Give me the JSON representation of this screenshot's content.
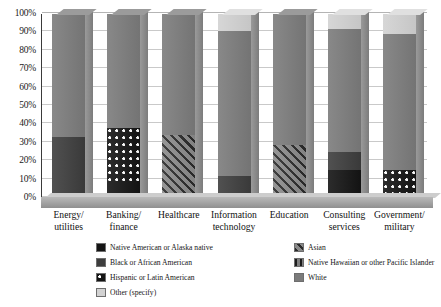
{
  "chart_data": {
    "type": "bar",
    "subtype": "100-percent-stacked-bar-3d",
    "title": "",
    "subtitle": "",
    "xlabel": "",
    "ylabel": "",
    "ylim": [
      0,
      100
    ],
    "yticks": [
      "0%",
      "10%",
      "20%",
      "30%",
      "40%",
      "50%",
      "60%",
      "70%",
      "80%",
      "90%",
      "100%"
    ],
    "ytick_values": [
      0,
      10,
      20,
      30,
      40,
      50,
      60,
      70,
      80,
      90,
      100
    ],
    "grid": true,
    "legend_position": "bottom",
    "categories": [
      "Energy/ utilities",
      "Banking/ finance",
      "Healthcare",
      "Information technology",
      "Education",
      "Consulting services",
      "Government/ military"
    ],
    "category_lines": [
      [
        "Energy/",
        "utilities"
      ],
      [
        "Banking/",
        "finance"
      ],
      [
        "Healthcare",
        ""
      ],
      [
        "Information",
        "technology"
      ],
      [
        "Education",
        ""
      ],
      [
        "Consulting",
        "services"
      ],
      [
        "Government/",
        "military"
      ]
    ],
    "series": [
      {
        "name": "Native American or Alaska native",
        "key": "native",
        "color": "#141414",
        "pattern": "solid-black",
        "values": [
          0,
          8,
          0,
          0,
          0,
          15,
          0
        ]
      },
      {
        "name": "Black or African American",
        "key": "black",
        "color": "#3d3d3d",
        "pattern": "solid-dark-gray",
        "values": [
          33,
          0,
          0,
          12,
          0,
          10,
          0
        ]
      },
      {
        "name": "Hispanic or Latin American",
        "key": "hispanic",
        "color": "#141414",
        "pattern": "black-with-white-dots",
        "values": [
          0,
          30,
          0,
          0,
          0,
          0,
          15
        ]
      },
      {
        "name": "Other (specify)",
        "key": "other",
        "color": "#d2d2d2",
        "pattern": "solid-light-gray",
        "values": [
          0,
          0,
          0,
          9,
          0,
          8,
          11
        ]
      },
      {
        "name": "Asian",
        "key": "asian",
        "color": "#8a8a8a",
        "pattern": "diagonal-hatch",
        "values": [
          0,
          0,
          34,
          0,
          29,
          0,
          0
        ]
      },
      {
        "name": "Native Hawaiian or other Pacific Islander",
        "key": "hawaiian",
        "color": "#7f7f7f",
        "pattern": "vertical-stripes",
        "values": [
          0,
          0,
          0,
          0,
          0,
          0,
          0
        ]
      },
      {
        "name": "White",
        "key": "white",
        "color": "#7b7b7b",
        "pattern": "solid-medium-gray",
        "values": [
          67,
          62,
          66,
          79,
          71,
          67,
          74
        ]
      }
    ],
    "stack_order_bottom_to_top": [
      "native",
      "black",
      "hispanic",
      "asian",
      "hawaiian",
      "white",
      "other"
    ],
    "bars": [
      {
        "category": "Energy/ utilities",
        "segments": [
          {
            "key": "black",
            "label": "Black or African American",
            "value": 33,
            "from": 0,
            "to": 33
          },
          {
            "key": "white",
            "label": "White",
            "value": 67,
            "from": 33,
            "to": 100
          }
        ]
      },
      {
        "category": "Banking/ finance",
        "segments": [
          {
            "key": "native",
            "label": "Native American or Alaska native",
            "value": 8,
            "from": 0,
            "to": 8
          },
          {
            "key": "hispanic",
            "label": "Hispanic or Latin American",
            "value": 30,
            "from": 8,
            "to": 38
          },
          {
            "key": "white",
            "label": "White",
            "value": 62,
            "from": 38,
            "to": 100
          }
        ]
      },
      {
        "category": "Healthcare",
        "segments": [
          {
            "key": "asian",
            "label": "Asian",
            "value": 34,
            "from": 0,
            "to": 34
          },
          {
            "key": "white",
            "label": "White",
            "value": 66,
            "from": 34,
            "to": 100
          }
        ]
      },
      {
        "category": "Information technology",
        "segments": [
          {
            "key": "black",
            "label": "Black or African American",
            "value": 12,
            "from": 0,
            "to": 12
          },
          {
            "key": "white",
            "label": "White",
            "value": 79,
            "from": 12,
            "to": 91
          },
          {
            "key": "other",
            "label": "Other (specify)",
            "value": 9,
            "from": 91,
            "to": 100
          }
        ]
      },
      {
        "category": "Education",
        "segments": [
          {
            "key": "asian",
            "label": "Asian",
            "value": 29,
            "from": 0,
            "to": 29
          },
          {
            "key": "white",
            "label": "White",
            "value": 71,
            "from": 29,
            "to": 100
          }
        ]
      },
      {
        "category": "Consulting services",
        "segments": [
          {
            "key": "native",
            "label": "Native American or Alaska native",
            "value": 15,
            "from": 0,
            "to": 15
          },
          {
            "key": "black",
            "label": "Black or African American",
            "value": 10,
            "from": 15,
            "to": 25
          },
          {
            "key": "white",
            "label": "White",
            "value": 67,
            "from": 25,
            "to": 92
          },
          {
            "key": "other",
            "label": "Other (specify)",
            "value": 8,
            "from": 92,
            "to": 100
          }
        ]
      },
      {
        "category": "Government/ military",
        "segments": [
          {
            "key": "hispanic",
            "label": "Hispanic or Latin American",
            "value": 15,
            "from": 0,
            "to": 15
          },
          {
            "key": "white",
            "label": "White",
            "value": 74,
            "from": 15,
            "to": 89
          },
          {
            "key": "other",
            "label": "Other (specify)",
            "value": 11,
            "from": 89,
            "to": 100
          }
        ]
      }
    ]
  },
  "legend": {
    "column1": [
      {
        "key": "native",
        "label": "Native American or Alaska native"
      },
      {
        "key": "black",
        "label": "Black or African American"
      },
      {
        "key": "hispanic",
        "label": "Hispanic or Latin American"
      },
      {
        "key": "other",
        "label": "Other (specify)"
      }
    ],
    "column2": [
      {
        "key": "asian",
        "label": "Asian"
      },
      {
        "key": "hawaiian",
        "label": "Native Hawaiian or other Pacific Islander"
      },
      {
        "key": "white",
        "label": "White"
      }
    ]
  }
}
